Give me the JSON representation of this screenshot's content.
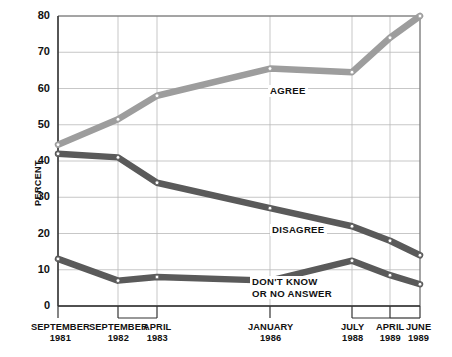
{
  "chart_data": {
    "type": "line",
    "title": "",
    "subtitle": "",
    "xlabel": "",
    "ylabel": "PERCENT",
    "ylim": [
      0,
      80
    ],
    "yticks": [
      0,
      10,
      20,
      30,
      40,
      50,
      60,
      70,
      80
    ],
    "ytick_labels": [
      "0",
      "10",
      "20",
      "30",
      "40",
      "50",
      "60",
      "70",
      "80"
    ],
    "grid": true,
    "legend_position": "inline-annotations",
    "categories": [
      "SEPTEMBER 1981",
      "SEPTEMBER 1982",
      "APRIL 1983",
      "JANUARY 1986",
      "JULY 1988",
      "APRIL 1989",
      "JUNE 1989"
    ],
    "xtick_labels": [
      {
        "month": "SEPTEMBER",
        "year": "1981"
      },
      {
        "month": "SEPTEMBER",
        "year": "1982"
      },
      {
        "month": "APRIL",
        "year": "1983"
      },
      {
        "month": "JANUARY",
        "year": "1986"
      },
      {
        "month": "JULY",
        "year": "1988"
      },
      {
        "month": "APRIL",
        "year": "1989"
      },
      {
        "month": "JUNE",
        "year": "1989"
      }
    ],
    "series": [
      {
        "name": "AGREE",
        "color": "#9d9d9d",
        "values": [
          44.5,
          51.5,
          58,
          65.5,
          64.5,
          74,
          80
        ],
        "annotation": "AGREE"
      },
      {
        "name": "DISAGREE",
        "color": "#5a5a5a",
        "values": [
          42,
          41,
          34,
          27,
          22,
          18,
          14
        ],
        "annotation": "DISAGREE"
      },
      {
        "name": "DON'T KNOW OR NO ANSWER",
        "color": "#5a5a5a",
        "values": [
          13,
          7,
          8,
          7,
          12.5,
          8.5,
          6
        ],
        "annotation_line1": "DON'T KNOW",
        "annotation_line2": "OR NO ANSWER"
      }
    ]
  },
  "annotations": {
    "agree": "AGREE",
    "disagree": "DISAGREE",
    "dontknow_line1": "DON'T KNOW",
    "dontknow_line2": "OR NO ANSWER"
  },
  "axis": {
    "y_title": "PERCENT"
  }
}
